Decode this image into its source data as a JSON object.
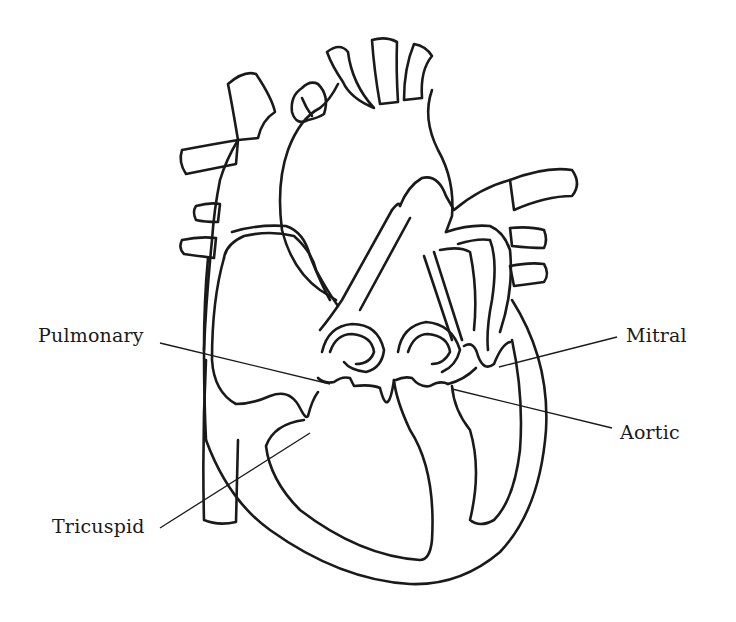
{
  "diagram": {
    "line_color": "#1a1a1a",
    "background": "#ffffff",
    "labels": [
      {
        "id": "pulmonary",
        "text": "Pulmonary",
        "x": 38,
        "y": 324,
        "line": [
          160,
          343,
          330,
          384
        ]
      },
      {
        "id": "mitral",
        "text": "Mitral",
        "x": 626,
        "y": 324,
        "line": [
          617,
          337,
          499,
          367
        ]
      },
      {
        "id": "aortic",
        "text": "Aortic",
        "x": 620,
        "y": 421,
        "line": [
          612,
          428,
          452,
          389
        ]
      },
      {
        "id": "tricuspid",
        "text": "Tricuspid",
        "x": 52,
        "y": 515,
        "line": [
          160,
          528,
          310,
          433
        ]
      }
    ]
  }
}
